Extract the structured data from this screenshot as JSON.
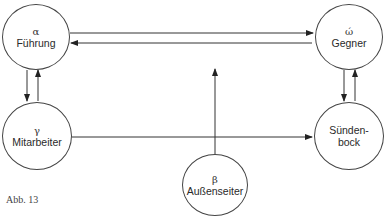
{
  "nodes": {
    "fuehrung": {
      "greek": "α",
      "label": "Führung"
    },
    "gegner": {
      "greek": "ώ",
      "label": "Gegner"
    },
    "mitarbeiter": {
      "greek": "γ",
      "label": "Mitarbeiter"
    },
    "suendenbock": {
      "greek": "",
      "label": "Sünden-\nbock"
    },
    "aussenseiter": {
      "greek": "β",
      "label": "Außenseiter"
    }
  },
  "edges": [
    {
      "from": "Führung",
      "to": "Gegner"
    },
    {
      "from": "Gegner",
      "to": "Führung"
    },
    {
      "from": "Führung",
      "to": "Mitarbeiter"
    },
    {
      "from": "Mitarbeiter",
      "to": "Führung"
    },
    {
      "from": "Gegner",
      "to": "Sündenbock"
    },
    {
      "from": "Sündenbock",
      "to": "Gegner"
    },
    {
      "from": "Mitarbeiter",
      "to": "Sündenbock"
    },
    {
      "from": "Außenseiter",
      "to": "upward"
    }
  ],
  "caption": "Abb. 13"
}
